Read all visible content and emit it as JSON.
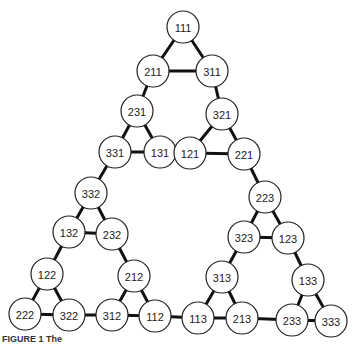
{
  "diagram": {
    "type": "sierpinski-graph",
    "node_radius": 16,
    "nodes": [
      {
        "id": "111",
        "x": 183,
        "y": 27
      },
      {
        "id": "211",
        "x": 153,
        "y": 71
      },
      {
        "id": "311",
        "x": 212,
        "y": 71
      },
      {
        "id": "231",
        "x": 137,
        "y": 111
      },
      {
        "id": "321",
        "x": 222,
        "y": 114
      },
      {
        "id": "331",
        "x": 115,
        "y": 152
      },
      {
        "id": "131",
        "x": 160,
        "y": 152
      },
      {
        "id": "121",
        "x": 190,
        "y": 153
      },
      {
        "id": "221",
        "x": 244,
        "y": 154
      },
      {
        "id": "332",
        "x": 91,
        "y": 193
      },
      {
        "id": "223",
        "x": 265,
        "y": 197
      },
      {
        "id": "132",
        "x": 69,
        "y": 232
      },
      {
        "id": "232",
        "x": 112,
        "y": 234
      },
      {
        "id": "323",
        "x": 244,
        "y": 237
      },
      {
        "id": "123",
        "x": 288,
        "y": 238
      },
      {
        "id": "122",
        "x": 47,
        "y": 274
      },
      {
        "id": "212",
        "x": 134,
        "y": 276
      },
      {
        "id": "313",
        "x": 222,
        "y": 277
      },
      {
        "id": "133",
        "x": 308,
        "y": 280
      },
      {
        "id": "222",
        "x": 25,
        "y": 314
      },
      {
        "id": "322",
        "x": 69,
        "y": 315
      },
      {
        "id": "312",
        "x": 112,
        "y": 315
      },
      {
        "id": "112",
        "x": 155,
        "y": 316
      },
      {
        "id": "113",
        "x": 198,
        "y": 318
      },
      {
        "id": "213",
        "x": 242,
        "y": 318
      },
      {
        "id": "233",
        "x": 292,
        "y": 320
      },
      {
        "id": "333",
        "x": 331,
        "y": 321
      }
    ],
    "edges": [
      [
        "111",
        "211"
      ],
      [
        "111",
        "311"
      ],
      [
        "211",
        "311"
      ],
      [
        "211",
        "231"
      ],
      [
        "311",
        "321"
      ],
      [
        "231",
        "331"
      ],
      [
        "231",
        "131"
      ],
      [
        "331",
        "131"
      ],
      [
        "131",
        "121"
      ],
      [
        "321",
        "121"
      ],
      [
        "321",
        "221"
      ],
      [
        "121",
        "221"
      ],
      [
        "331",
        "332"
      ],
      [
        "221",
        "223"
      ],
      [
        "332",
        "132"
      ],
      [
        "332",
        "232"
      ],
      [
        "132",
        "232"
      ],
      [
        "223",
        "323"
      ],
      [
        "223",
        "123"
      ],
      [
        "323",
        "123"
      ],
      [
        "132",
        "122"
      ],
      [
        "232",
        "212"
      ],
      [
        "323",
        "313"
      ],
      [
        "123",
        "133"
      ],
      [
        "122",
        "222"
      ],
      [
        "122",
        "322"
      ],
      [
        "222",
        "322"
      ],
      [
        "212",
        "312"
      ],
      [
        "212",
        "112"
      ],
      [
        "312",
        "112"
      ],
      [
        "322",
        "312"
      ],
      [
        "112",
        "113"
      ],
      [
        "313",
        "113"
      ],
      [
        "313",
        "213"
      ],
      [
        "113",
        "213"
      ],
      [
        "213",
        "233"
      ],
      [
        "133",
        "233"
      ],
      [
        "133",
        "333"
      ],
      [
        "233",
        "333"
      ]
    ]
  },
  "caption": "FIGURE 1   The"
}
